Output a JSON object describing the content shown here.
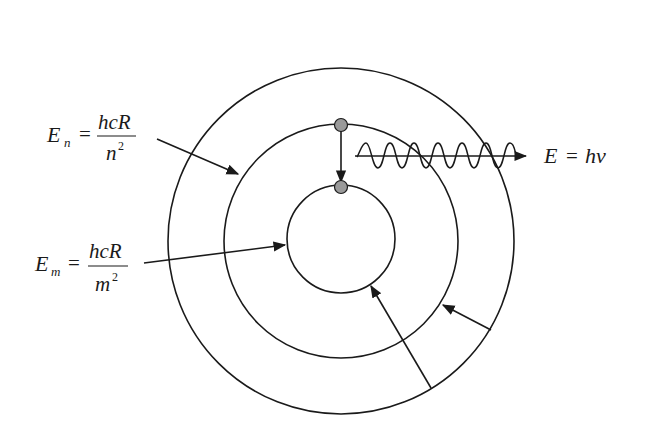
{
  "figure": {
    "labels": {
      "en": {
        "lhs": "E",
        "sub": "n",
        "num": "hcR",
        "den": "n",
        "exp": "2"
      },
      "em": {
        "lhs": "E",
        "sub": "m",
        "num": "hcR",
        "den": "m",
        "exp": "2"
      },
      "photon": {
        "lhs": "E",
        "eq": "=",
        "rhs": "hν"
      },
      "equals": "="
    },
    "orbits": [
      {
        "name": "outer-orbit",
        "r": 174
      },
      {
        "name": "middle-orbit-n",
        "r": 117
      },
      {
        "name": "inner-orbit-m",
        "r": 54
      }
    ],
    "center": {
      "x": 341,
      "y": 238
    },
    "colors": {
      "line": "#1a1a1a",
      "electron": "#9a9a9a",
      "background": "#ffffff"
    }
  }
}
